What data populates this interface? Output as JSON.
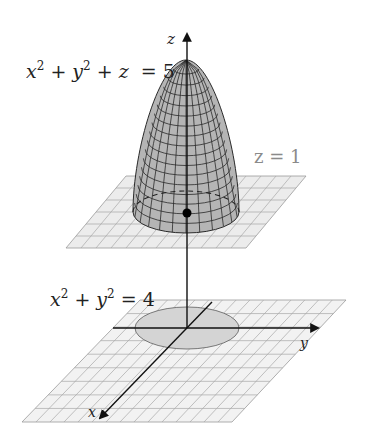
{
  "figure": {
    "surface_equation": {
      "var1": "x",
      "exp1": "2",
      "plus1": " + ",
      "var2": "y",
      "exp2": "2",
      "plus2": " + ",
      "var3": "z",
      "rhs": "  = 5"
    },
    "plane_label": "z = 1",
    "circle_equation": {
      "var1": "x",
      "exp1": "2",
      "plus": " + ",
      "var2": "y",
      "exp2": "2",
      "rhs": " = 4"
    },
    "axes": {
      "z": "z",
      "y": "y",
      "x": "x"
    },
    "colors": {
      "surface_fill": "#b5b5b5",
      "surface_mesh": "#2a2a2a",
      "plane_fill": "#ededed",
      "plane_grid": "#9a9a9a",
      "disk_fill": "#d4d4d4",
      "axis": "#111111",
      "plane_label": "#8a8a8a"
    }
  }
}
